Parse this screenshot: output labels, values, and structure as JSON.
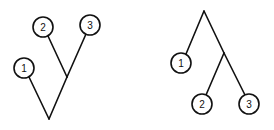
{
  "diagram": {
    "type": "phylogenetic-trees",
    "trees": [
      {
        "name": "left-tree",
        "nodes": [
          {
            "label": "1",
            "cx": 24,
            "cy": 68
          },
          {
            "label": "2",
            "cx": 43,
            "cy": 27
          },
          {
            "label": "3",
            "cx": 90,
            "cy": 25
          }
        ],
        "root": {
          "x": 49,
          "y": 119
        },
        "junction": {
          "x": 67,
          "y": 77
        }
      },
      {
        "name": "right-tree",
        "nodes": [
          {
            "label": "1",
            "cx": 181,
            "cy": 63
          },
          {
            "label": "2",
            "cx": 202,
            "cy": 104
          },
          {
            "label": "3",
            "cx": 249,
            "cy": 104
          }
        ],
        "root": {
          "x": 204,
          "y": 11
        },
        "junction": {
          "x": 224,
          "y": 53
        }
      }
    ]
  }
}
